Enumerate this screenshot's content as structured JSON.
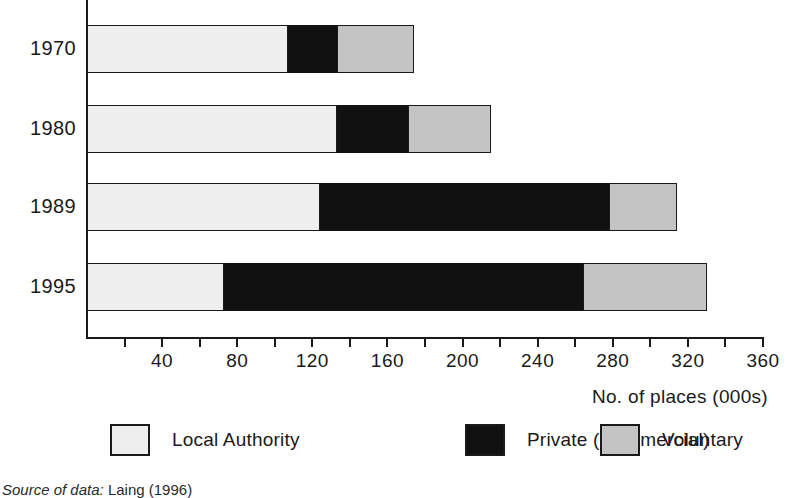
{
  "chart_data": {
    "type": "bar",
    "orientation": "horizontal",
    "stacked": true,
    "title": "",
    "xlabel": "No. of places (000s)",
    "ylabel": "",
    "categories": [
      "1970",
      "1980",
      "1989",
      "1995"
    ],
    "series": [
      {
        "name": "Local Authority",
        "color": "#eeeeee",
        "values": [
          107,
          133,
          124,
          73
        ]
      },
      {
        "name": "Private (Commercial)",
        "color": "#111111",
        "values": [
          26,
          38,
          154,
          191
        ]
      },
      {
        "name": "Voluntary",
        "color": "#c4c4c4",
        "values": [
          41,
          44,
          36,
          66
        ]
      }
    ],
    "totals": [
      174,
      215,
      314,
      330
    ],
    "xlim": [
      0,
      360
    ],
    "xticks": [
      0,
      20,
      40,
      60,
      80,
      100,
      120,
      140,
      160,
      180,
      200,
      220,
      240,
      260,
      280,
      300,
      320,
      340,
      360
    ],
    "xtick_labels": [
      "40",
      "80",
      "120",
      "160",
      "200",
      "240",
      "280",
      "320",
      "360"
    ],
    "xtick_label_values": [
      40,
      80,
      120,
      160,
      200,
      240,
      280,
      320,
      360
    ],
    "grid": false,
    "legend_position": "bottom"
  },
  "axis": {
    "x_title": "No. of places (000s)"
  },
  "legend": {
    "items": [
      {
        "label": "Local Authority",
        "swatch": "light-gray-swatch"
      },
      {
        "label": "Private (Commercial)",
        "swatch": "black-swatch"
      },
      {
        "label": "Voluntary",
        "swatch": "gray-swatch"
      }
    ]
  },
  "footer": {
    "source_label": "Source of data:",
    "source_value": "Laing (1996)"
  },
  "colors": {
    "local_authority": "#eeeeee",
    "private_commercial": "#111111",
    "voluntary": "#c4c4c4",
    "axis": "#1a1a1a"
  }
}
